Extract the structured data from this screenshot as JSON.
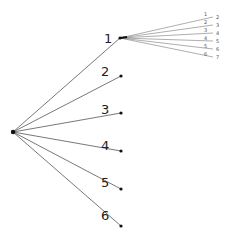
{
  "diagram": {
    "type": "tree",
    "root": {
      "x": 13,
      "y": 132
    },
    "children": [
      {
        "label": "1",
        "x": 120,
        "y": 38,
        "lx": 104,
        "ly": 43
      },
      {
        "label": "2",
        "x": 121,
        "y": 76,
        "lx": 101,
        "ly": 76
      },
      {
        "label": "3",
        "x": 121,
        "y": 113,
        "lx": 101,
        "ly": 114
      },
      {
        "label": "4",
        "x": 121,
        "y": 151,
        "lx": 101,
        "ly": 150
      },
      {
        "label": "5",
        "x": 121,
        "y": 189,
        "lx": 101,
        "ly": 187
      },
      {
        "label": "6",
        "x": 121,
        "y": 226,
        "lx": 101,
        "ly": 220
      }
    ],
    "sub_fan": {
      "origin": {
        "x": 120,
        "y": 38
      },
      "edges": [
        {
          "label": "1",
          "end_label": "2",
          "x": 213,
          "y": 17
        },
        {
          "label": "2",
          "end_label": "3",
          "x": 213,
          "y": 25
        },
        {
          "label": "3",
          "end_label": "4",
          "x": 213,
          "y": 33
        },
        {
          "label": "4",
          "end_label": "5",
          "x": 213,
          "y": 41
        },
        {
          "label": "5",
          "end_label": "6",
          "x": 213,
          "y": 49
        },
        {
          "label": "6",
          "end_label": "7",
          "x": 213,
          "y": 57
        }
      ]
    }
  }
}
